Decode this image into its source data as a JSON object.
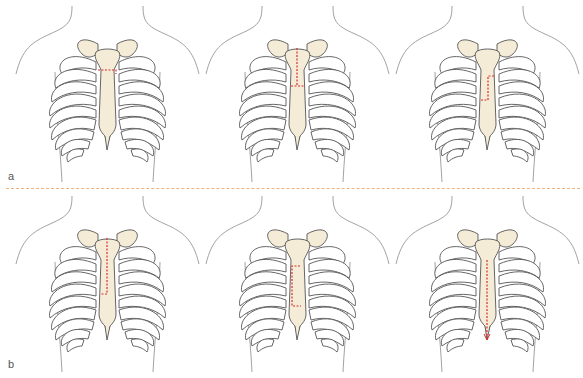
{
  "figure": {
    "rows": [
      {
        "label": "a",
        "panels": [
          {
            "id": "a1",
            "incision": "transverse-partial",
            "description": "Short transverse cut at manubrium-body junction"
          },
          {
            "id": "a2",
            "incision": "upper-vertical-with-transverse",
            "description": "Vertical cut through manubrium to upper body with transverse cut"
          },
          {
            "id": "a3",
            "incision": "reverse-L-mid",
            "description": "Inverted L cut in mid sternal body"
          }
        ]
      },
      {
        "label": "b",
        "panels": [
          {
            "id": "b1",
            "incision": "upper-vertical-J",
            "description": "Vertical cut from sternal notch to mid body with lateral J exit"
          },
          {
            "id": "b2",
            "incision": "lower-rectangular",
            "description": "Rectangular window in lower sternal body"
          },
          {
            "id": "b3",
            "incision": "lower-vertical-to-xiphoid",
            "description": "Vertical cut from body to xiphoid with arrow"
          }
        ]
      }
    ],
    "colors": {
      "incision": "#d62e2e",
      "bone_fill": "#f5ecd8",
      "outline": "#555555",
      "body_outline": "#8a8a8a",
      "divider": "#f0b27a"
    }
  }
}
